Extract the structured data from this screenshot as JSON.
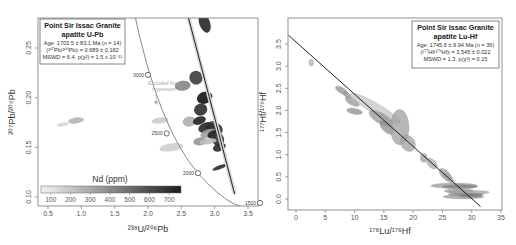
{
  "chart_data": [
    {
      "type": "scatter",
      "subtype": "Tera-Wasserburg concordia with error ellipses",
      "title": "Point Sir Issac Granite",
      "subtitle": "apatite U-Pb",
      "xlabel": "238U/206Pb",
      "ylabel": "207Pb/206Pb",
      "xlim": [
        0.35,
        3.7
      ],
      "ylim": [
        0.09,
        0.285
      ],
      "xticks": [
        "0.5",
        "1.0",
        "1.5",
        "2.0",
        "2.5",
        "3.0",
        "3.5"
      ],
      "yticks": [
        "0.10",
        "0.15",
        "0.20",
        "0.25"
      ],
      "grid": false,
      "stats": {
        "age_line": "Age: 1703.5 ± 83.1 Ma (n = 14)",
        "initial_line": "(207Pb/206Pb)i = 0.689 ± 0.162",
        "mswd_line": "MSWD = 6.4, p(χ²) = 1.5 x 10⁻¹¹"
      },
      "concordia_ages": [
        {
          "label": "3000",
          "x": 2.0,
          "y": 0.223
        },
        {
          "label": "2500",
          "x": 2.28,
          "y": 0.164
        },
        {
          "label": "2000",
          "x": 2.75,
          "y": 0.124
        },
        {
          "label": "1500",
          "x": 3.68,
          "y": 0.094
        }
      ],
      "annotation": "Excluded from regression",
      "colorbar": {
        "title": "Nd (ppm)",
        "ticks": [
          "100",
          "200",
          "300",
          "400",
          "500",
          "600",
          "700"
        ],
        "range": [
          50,
          760
        ]
      },
      "ellipses": [
        {
          "x": 2.85,
          "y": 0.275,
          "rx": 0.08,
          "ry": 0.01,
          "nd": 700,
          "excluded": false
        },
        {
          "x": 2.52,
          "y": 0.212,
          "rx": 0.12,
          "ry": 0.005,
          "nd": 380,
          "excluded": true
        },
        {
          "x": 2.72,
          "y": 0.22,
          "rx": 0.1,
          "ry": 0.007,
          "nd": 620,
          "excluded": false
        },
        {
          "x": 2.85,
          "y": 0.2,
          "rx": 0.12,
          "ry": 0.006,
          "nd": 760,
          "excluded": false
        },
        {
          "x": 2.79,
          "y": 0.188,
          "rx": 0.1,
          "ry": 0.006,
          "nd": 680,
          "excluded": false
        },
        {
          "x": 0.92,
          "y": 0.177,
          "rx": 0.12,
          "ry": 0.003,
          "nd": 230,
          "excluded": true
        },
        {
          "x": 0.72,
          "y": 0.173,
          "rx": 0.09,
          "ry": 0.002,
          "nd": 120,
          "excluded": true
        },
        {
          "x": 2.18,
          "y": 0.177,
          "rx": 0.13,
          "ry": 0.003,
          "nd": 150,
          "excluded": true
        },
        {
          "x": 2.62,
          "y": 0.176,
          "rx": 0.1,
          "ry": 0.005,
          "nd": 250,
          "excluded": true
        },
        {
          "x": 2.77,
          "y": 0.177,
          "rx": 0.1,
          "ry": 0.004,
          "nd": 720,
          "excluded": false
        },
        {
          "x": 2.95,
          "y": 0.172,
          "rx": 0.1,
          "ry": 0.004,
          "nd": 600,
          "excluded": false
        },
        {
          "x": 2.87,
          "y": 0.17,
          "rx": 0.12,
          "ry": 0.005,
          "nd": 690,
          "excluded": false
        },
        {
          "x": 3.04,
          "y": 0.168,
          "rx": 0.08,
          "ry": 0.006,
          "nd": 650,
          "excluded": false
        },
        {
          "x": 2.9,
          "y": 0.164,
          "rx": 0.12,
          "ry": 0.004,
          "nd": 300,
          "excluded": false
        },
        {
          "x": 2.98,
          "y": 0.163,
          "rx": 0.09,
          "ry": 0.004,
          "nd": 720,
          "excluded": false
        },
        {
          "x": 3.05,
          "y": 0.158,
          "rx": 0.09,
          "ry": 0.007,
          "nd": 660,
          "excluded": false
        },
        {
          "x": 2.78,
          "y": 0.156,
          "rx": 0.1,
          "ry": 0.004,
          "nd": 330,
          "excluded": true
        },
        {
          "x": 2.9,
          "y": 0.156,
          "rx": 0.13,
          "ry": 0.003,
          "nd": 200,
          "excluded": true
        },
        {
          "x": 2.35,
          "y": 0.15,
          "rx": 0.18,
          "ry": 0.004,
          "nd": 140,
          "excluded": true
        },
        {
          "x": 3.07,
          "y": 0.15,
          "rx": 0.1,
          "ry": 0.004,
          "nd": 690,
          "excluded": false
        },
        {
          "x": 3.08,
          "y": 0.13,
          "rx": 0.12,
          "ry": 0.002,
          "nd": 680,
          "excluded": false
        }
      ],
      "regression_line": {
        "x0": 2.55,
        "y0": 0.295,
        "x1": 3.3,
        "y1": 0.103
      }
    },
    {
      "type": "scatter",
      "subtype": "isochron with error ellipses",
      "title": "Point Sir Issac Granite",
      "subtitle": "apatite Lu-Hf",
      "xlabel": "176Lu/176Hf",
      "ylabel": "177Hf/176Hf",
      "xlim": [
        -1.3,
        35.2
      ],
      "ylim": [
        -0.2,
        3.75
      ],
      "xticks": [
        "0",
        "5",
        "10",
        "15",
        "20",
        "25",
        "30",
        "35"
      ],
      "yticks": [
        "0.0",
        "0.5",
        "1.0",
        "1.5",
        "2.0",
        "2.5",
        "3.0",
        "3.5"
      ],
      "grid": false,
      "stats": {
        "age_line": "Age: 1745.6 ± 9.94 Ma (n = 36)",
        "initial_line": "(177Hf/176Hf)i = 3.545 ± 0.022",
        "mswd_line": "MSWD = 1.3, p(χ²) = 0.15"
      },
      "ellipses": [
        {
          "x": 2.6,
          "y": 3.08,
          "rx": 0.4,
          "ry": 0.08,
          "rot": 0,
          "shade": 0.3
        },
        {
          "x": 7.8,
          "y": 2.45,
          "rx": 0.5,
          "ry": 0.16,
          "rot": -60,
          "shade": 0.5
        },
        {
          "x": 8.7,
          "y": 2.35,
          "rx": 0.4,
          "ry": 0.1,
          "rot": -55,
          "shade": 0.45
        },
        {
          "x": 9.6,
          "y": 2.2,
          "rx": 0.6,
          "ry": 0.18,
          "rot": -60,
          "shade": 0.45
        },
        {
          "x": 10.0,
          "y": 1.98,
          "rx": 0.5,
          "ry": 0.18,
          "rot": -80,
          "shade": 0.5
        },
        {
          "x": 13.5,
          "y": 2.05,
          "rx": 0.9,
          "ry": 0.65,
          "rot": -60,
          "shade": 0.2
        },
        {
          "x": 14.5,
          "y": 1.82,
          "rx": 0.9,
          "ry": 0.3,
          "rot": -60,
          "shade": 0.45
        },
        {
          "x": 15.5,
          "y": 1.62,
          "rx": 0.8,
          "ry": 0.2,
          "rot": -45,
          "shade": 0.5
        },
        {
          "x": 17.7,
          "y": 1.62,
          "rx": 1.6,
          "ry": 0.4,
          "rot": 0,
          "shade": 0.4
        },
        {
          "x": 19.1,
          "y": 1.26,
          "rx": 1.2,
          "ry": 0.2,
          "rot": -35,
          "shade": 0.4
        },
        {
          "x": 21.8,
          "y": 0.93,
          "rx": 0.6,
          "ry": 0.1,
          "rot": 0,
          "shade": 0.4
        },
        {
          "x": 23.2,
          "y": 0.8,
          "rx": 0.7,
          "ry": 0.15,
          "rot": -45,
          "shade": 0.35
        },
        {
          "x": 25.5,
          "y": 0.55,
          "rx": 0.7,
          "ry": 0.18,
          "rot": -45,
          "shade": 0.4
        },
        {
          "x": 26.0,
          "y": 0.48,
          "rx": 0.6,
          "ry": 0.15,
          "rot": -45,
          "shade": 0.35
        },
        {
          "x": 27.0,
          "y": 0.3,
          "rx": 4.0,
          "ry": 0.06,
          "rot": 0,
          "shade": 0.45
        },
        {
          "x": 28.0,
          "y": 0.28,
          "rx": 3.0,
          "ry": 0.05,
          "rot": 0,
          "shade": 0.55
        },
        {
          "x": 27.8,
          "y": 0.18,
          "rx": 2.5,
          "ry": 0.05,
          "rot": 0,
          "shade": 0.45
        },
        {
          "x": 29.5,
          "y": 0.15,
          "rx": 3.5,
          "ry": 0.05,
          "rot": 0,
          "shade": 0.4
        },
        {
          "x": 29.0,
          "y": 0.1,
          "rx": 3.0,
          "ry": 0.04,
          "rot": 0,
          "shade": 0.55
        },
        {
          "x": 28.6,
          "y": 0.05,
          "rx": 3.5,
          "ry": 0.05,
          "rot": 0,
          "shade": 0.45
        },
        {
          "x": 29.8,
          "y": 0.08,
          "rx": 2.0,
          "ry": 0.04,
          "rot": 0,
          "shade": 0.6
        }
      ],
      "regression_line": {
        "x0": -1.3,
        "y0": 3.7,
        "x1": 31.5,
        "y1": -0.17
      }
    }
  ],
  "left_panel": {
    "box_title_1": "Point Sir Issac Granite",
    "box_title_2": "apatite U-Pb",
    "box_line_1": "Age: 1703.5 ± 83.1 Ma (n = 14)",
    "box_line_2": "(²⁰⁷Pb/²⁰⁶Pb)ᵢ = 0.689 ± 0.162",
    "box_line_3": "MSWD = 6.4, p(χ²) = 1.5 x 10⁻¹¹",
    "xlabel": "²³⁸U/²⁰⁶Pb",
    "ylabel": "²⁰⁷Pb/²⁰⁶Pb",
    "annotation_1": "Excluded from",
    "annotation_2": "regression",
    "colorbar_title": "Nd (ppm)",
    "concordia_labels": [
      "3000",
      "2500",
      "2000",
      "1500"
    ]
  },
  "right_panel": {
    "box_title_1": "Point Sir Issac Granite",
    "box_title_2": "apatite Lu-Hf",
    "box_line_1": "Age: 1745.6 ± 9.94 Ma (n = 36)",
    "box_line_2": "(¹⁷⁷Hf/¹⁷⁶Hf)ᵢ = 3.545 ± 0.022",
    "box_line_3": "MSWD = 1.3, p(χ²) = 0.15",
    "xlabel": "¹⁷⁶Lu/¹⁷⁶Hf",
    "ylabel": "¹⁷⁷Hf/¹⁷⁶Hf"
  },
  "colors": {
    "frame": "#777777",
    "regression": "#222222",
    "concordia": "#888888",
    "ellipse_light": "#e6e6e6",
    "ellipse_dark": "#1c1c1c"
  }
}
